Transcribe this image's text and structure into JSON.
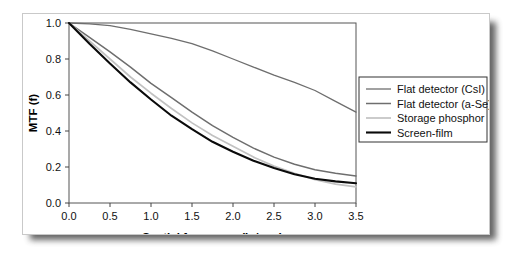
{
  "chart_data": {
    "type": "line",
    "title": "",
    "xlabel": "Spatial frequency (lp/mm)",
    "ylabel": "MTF (f)",
    "xlim": [
      0.0,
      3.5
    ],
    "ylim": [
      0.0,
      1.0
    ],
    "grid": false,
    "frame": "box",
    "legend_position": "right-outside",
    "xticks": [
      "0.0",
      "0.5",
      "1.0",
      "1.5",
      "2.0",
      "2.5",
      "3.0",
      "3.5"
    ],
    "xtick_values": [
      0.0,
      0.5,
      1.0,
      1.5,
      2.0,
      2.5,
      3.0,
      3.5
    ],
    "yticks": [
      "0.0",
      "0.2",
      "0.4",
      "0.6",
      "0.8",
      "1.0"
    ],
    "ytick_values": [
      0.0,
      0.2,
      0.4,
      0.6,
      0.8,
      1.0
    ],
    "x": [
      0.0,
      0.25,
      0.5,
      0.75,
      1.0,
      1.25,
      1.5,
      1.75,
      2.0,
      2.25,
      2.5,
      2.75,
      3.0,
      3.25,
      3.5
    ],
    "series": [
      {
        "name": "Flat detector (CsI)",
        "color": "#6e6e6e",
        "width": 1.3,
        "values": [
          1.0,
          0.995,
          0.985,
          0.965,
          0.94,
          0.915,
          0.885,
          0.845,
          0.8,
          0.755,
          0.71,
          0.67,
          0.625,
          0.565,
          0.505
        ]
      },
      {
        "name": "Flat detector (a-Se)",
        "color": "#6e6e6e",
        "width": 1.5,
        "values": [
          1.0,
          0.92,
          0.84,
          0.755,
          0.665,
          0.585,
          0.505,
          0.43,
          0.365,
          0.305,
          0.255,
          0.215,
          0.185,
          0.165,
          0.15
        ]
      },
      {
        "name": "Storage phosphor",
        "color": "#c2c2c2",
        "width": 1.7,
        "values": [
          1.0,
          0.9,
          0.8,
          0.7,
          0.61,
          0.525,
          0.445,
          0.375,
          0.315,
          0.255,
          0.205,
          0.165,
          0.13,
          0.105,
          0.09
        ]
      },
      {
        "name": "Screen-film",
        "color": "#0a0a0a",
        "width": 2.1,
        "values": [
          1.0,
          0.885,
          0.775,
          0.67,
          0.575,
          0.485,
          0.41,
          0.34,
          0.285,
          0.235,
          0.195,
          0.16,
          0.135,
          0.12,
          0.11
        ]
      }
    ]
  },
  "legend": {
    "entries": [
      {
        "label": "Flat detector (CsI)"
      },
      {
        "label": "Flat detector (a-Se)"
      },
      {
        "label": "Storage phosphor"
      },
      {
        "label": "Screen-film"
      }
    ]
  }
}
